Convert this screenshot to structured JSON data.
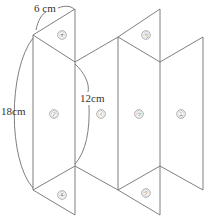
{
  "figure": {
    "dimensions": {
      "top_edge": "6 cm",
      "total_height": "18cm",
      "fold_height": "12cm"
    },
    "faces": {
      "a": "㋐",
      "i": "㋑",
      "u": "㋒",
      "e": "㋓",
      "o": "㋔",
      "ka": "㋕",
      "ki": "㋖",
      "ku": "㋗"
    },
    "colors": {
      "line": "#707070",
      "text": "#333333",
      "background": "#ffffff"
    }
  }
}
